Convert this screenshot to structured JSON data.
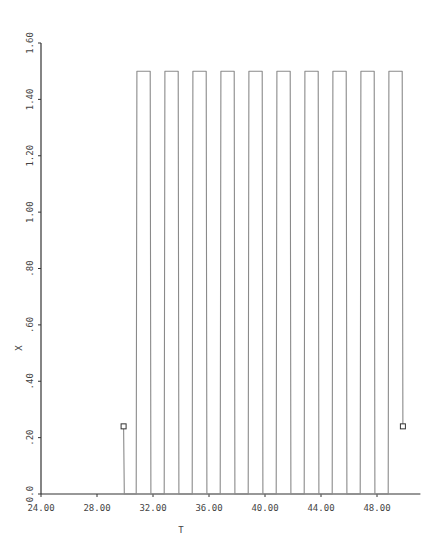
{
  "chart_data": {
    "type": "line",
    "title": "",
    "xlabel": "T",
    "ylabel": "X",
    "xlim": [
      24.0,
      51.1
    ],
    "ylim": [
      0.0,
      1.6
    ],
    "grid": false,
    "legend": null,
    "x_ticks": [
      "24.00",
      "28.00",
      "32.00",
      "36.00",
      "40.00",
      "44.00",
      "48.00"
    ],
    "x_tick_values": [
      24,
      28,
      32,
      36,
      40,
      44,
      48
    ],
    "y_ticks": [
      "0.0",
      ".20",
      ".40",
      ".60",
      ".80",
      "1.00",
      "1.20",
      "1.40",
      "1.60"
    ],
    "y_tick_values": [
      0.0,
      0.2,
      0.4,
      0.6,
      0.8,
      1.0,
      1.2,
      1.4,
      1.6
    ],
    "series": [
      {
        "name": "X",
        "description": "Square wave alternating between 0.0 and 1.50 with period 2.0, starting at X=0.24 (T≈29.9) and ending at X=0.24 (T≈49.8); square markers at start and end points",
        "x": [
          29.9,
          29.95,
          30.8,
          30.85,
          31.8,
          31.85,
          32.8,
          32.85,
          33.8,
          33.85,
          34.8,
          34.85,
          35.8,
          35.85,
          36.8,
          36.85,
          37.8,
          37.85,
          38.8,
          38.85,
          39.8,
          39.85,
          40.8,
          40.85,
          41.8,
          41.85,
          42.8,
          42.85,
          43.8,
          43.85,
          44.8,
          44.85,
          45.8,
          45.85,
          46.8,
          46.85,
          47.8,
          47.85,
          48.8,
          48.85,
          49.8,
          49.85
        ],
        "values": [
          0.24,
          0.0,
          0.0,
          1.5,
          1.5,
          0.0,
          0.0,
          1.5,
          1.5,
          0.0,
          0.0,
          1.5,
          1.5,
          0.0,
          0.0,
          1.5,
          1.5,
          0.0,
          0.0,
          1.5,
          1.5,
          0.0,
          0.0,
          1.5,
          1.5,
          0.0,
          0.0,
          1.5,
          1.5,
          0.0,
          0.0,
          1.5,
          1.5,
          0.0,
          0.0,
          1.5,
          1.5,
          0.0,
          0.0,
          1.5,
          1.5,
          0.24
        ],
        "high_level": 1.5,
        "low_level": 0.0,
        "period": 2.0,
        "pulse_count": 10,
        "markers": [
          {
            "x": 29.9,
            "y": 0.24,
            "shape": "square"
          },
          {
            "x": 49.85,
            "y": 0.24,
            "shape": "square"
          }
        ]
      }
    ]
  },
  "colors": {
    "line": "#8a8a8a",
    "axis": "#333333",
    "text": "#444444"
  }
}
